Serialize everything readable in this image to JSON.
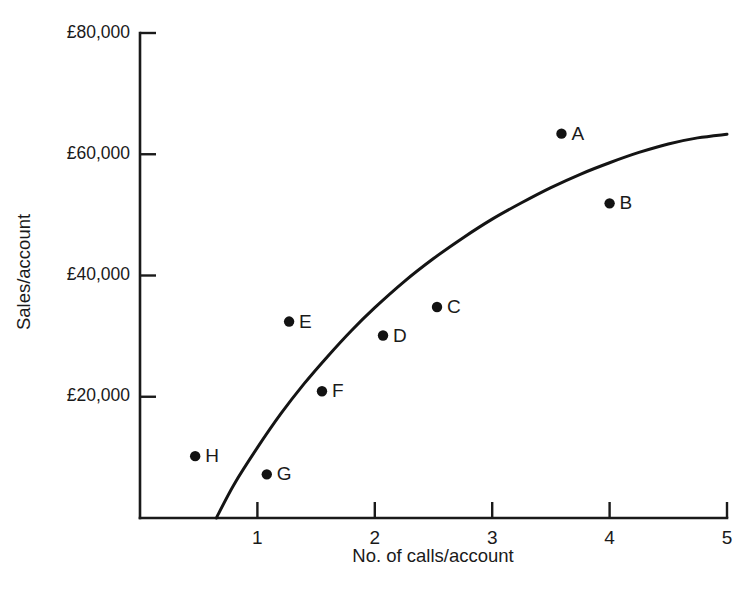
{
  "chart_data": {
    "type": "scatter",
    "title": "",
    "xlabel": "No. of calls/account",
    "ylabel": "Sales/account",
    "xlim": [
      0,
      5
    ],
    "ylim": [
      0,
      80000
    ],
    "grid": false,
    "legend": "none",
    "x_ticks": [
      {
        "value": 1,
        "label": "1"
      },
      {
        "value": 2,
        "label": "2"
      },
      {
        "value": 3,
        "label": "3"
      },
      {
        "value": 4,
        "label": "4"
      },
      {
        "value": 5,
        "label": "5"
      }
    ],
    "y_ticks": [
      {
        "value": 20000,
        "label": "£20,000"
      },
      {
        "value": 40000,
        "label": "£40,000"
      },
      {
        "value": 60000,
        "label": "£60,000"
      },
      {
        "value": 80000,
        "label": "£80,000"
      }
    ],
    "points": [
      {
        "label": "A",
        "x": 3.59,
        "y": 63400
      },
      {
        "label": "B",
        "x": 4.0,
        "y": 51900
      },
      {
        "label": "C",
        "x": 2.53,
        "y": 34800
      },
      {
        "label": "D",
        "x": 2.07,
        "y": 30100
      },
      {
        "label": "E",
        "x": 1.27,
        "y": 32400
      },
      {
        "label": "F",
        "x": 1.55,
        "y": 20900
      },
      {
        "label": "G",
        "x": 1.08,
        "y": 7200
      },
      {
        "label": "H",
        "x": 0.47,
        "y": 10200
      }
    ],
    "fit_curve": {
      "name": "response curve",
      "points": [
        {
          "x": 0.65,
          "y": 0
        },
        {
          "x": 0.8,
          "y": 5500
        },
        {
          "x": 1.0,
          "y": 11600
        },
        {
          "x": 1.2,
          "y": 17200
        },
        {
          "x": 1.4,
          "y": 22200
        },
        {
          "x": 1.6,
          "y": 26700
        },
        {
          "x": 1.8,
          "y": 30900
        },
        {
          "x": 2.0,
          "y": 34700
        },
        {
          "x": 2.25,
          "y": 39000
        },
        {
          "x": 2.5,
          "y": 42800
        },
        {
          "x": 2.75,
          "y": 46200
        },
        {
          "x": 3.0,
          "y": 49300
        },
        {
          "x": 3.25,
          "y": 52000
        },
        {
          "x": 3.5,
          "y": 54500
        },
        {
          "x": 3.75,
          "y": 56700
        },
        {
          "x": 4.0,
          "y": 58600
        },
        {
          "x": 4.25,
          "y": 60300
        },
        {
          "x": 4.5,
          "y": 61700
        },
        {
          "x": 4.75,
          "y": 62700
        },
        {
          "x": 5.0,
          "y": 63300
        }
      ]
    },
    "colors": {
      "axis": "#1a1a1a",
      "curve": "#141414",
      "point": "#121212",
      "background": "#ffffff"
    }
  }
}
